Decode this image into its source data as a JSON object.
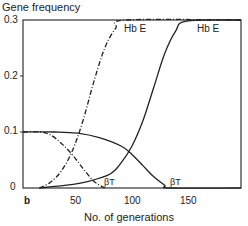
{
  "chart_data": {
    "type": "line",
    "title": "",
    "ylabel": "Gene frequency",
    "xlabel": "No. of generations",
    "xlim": [
      0,
      200
    ],
    "ylim": [
      0,
      0.3
    ],
    "x_ticks": [
      "50",
      "100",
      "150"
    ],
    "y_ticks": [
      "0",
      "0.1",
      "0.2",
      "0.3"
    ],
    "panel_label": "b",
    "grid": false,
    "series": [
      {
        "name": "Hb E (solid)",
        "style": "solid",
        "label": "Hb E",
        "x": [
          15,
          40,
          60,
          80,
          90,
          100,
          110,
          120,
          130,
          140,
          150,
          200
        ],
        "y": [
          0.0,
          0.005,
          0.012,
          0.025,
          0.045,
          0.075,
          0.12,
          0.18,
          0.24,
          0.28,
          0.298,
          0.3
        ]
      },
      {
        "name": "βT (solid)",
        "style": "solid",
        "label": "βT",
        "x": [
          0,
          30,
          50,
          70,
          90,
          100,
          110,
          120,
          130,
          135,
          200
        ],
        "y": [
          0.1,
          0.1,
          0.098,
          0.09,
          0.075,
          0.06,
          0.04,
          0.02,
          0.005,
          0.0,
          0.0
        ]
      },
      {
        "name": "Hb E (dash-dot)",
        "style": "dash-dot",
        "label": "Hb E",
        "x": [
          15,
          25,
          35,
          45,
          55,
          65,
          75,
          85,
          95,
          200
        ],
        "y": [
          0.0,
          0.01,
          0.03,
          0.065,
          0.12,
          0.19,
          0.25,
          0.285,
          0.3,
          0.3
        ]
      },
      {
        "name": "βT (dash-dot)",
        "style": "dash-dot",
        "label": "βT",
        "x": [
          0,
          15,
          25,
          35,
          45,
          55,
          65,
          75
        ],
        "y": [
          0.1,
          0.1,
          0.095,
          0.08,
          0.06,
          0.035,
          0.012,
          0.0
        ]
      }
    ],
    "annotations": [
      "Hb E",
      "Hb E",
      "βT",
      "βT"
    ]
  }
}
